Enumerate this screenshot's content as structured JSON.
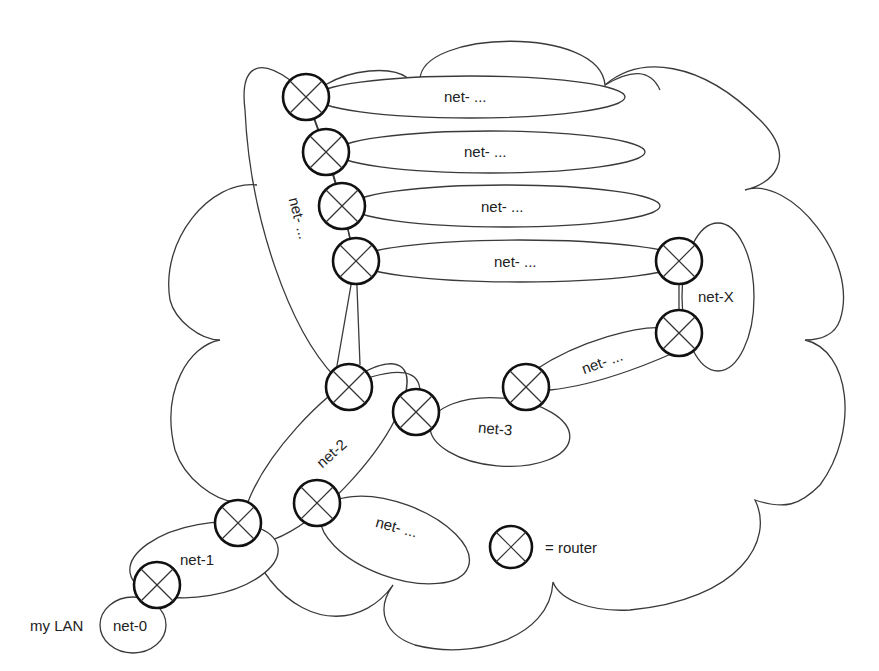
{
  "diagram": {
    "title": "",
    "labels": {
      "my_lan": "my LAN",
      "net0": "net-0",
      "net1": "net-1",
      "net2": "net-2",
      "net3": "net-3",
      "netX": "net-X",
      "net_top1": "net- ...",
      "net_top2": "net- ...",
      "net_top3": "net- ...",
      "net_top4": "net- ...",
      "net_vertical": "net- ...",
      "net_3_to_X": "net- ...",
      "net_bottom": "net- ..."
    },
    "legend": {
      "symbol": "router-icon",
      "text": "= router"
    },
    "routers": [
      {
        "id": "r0",
        "x": 157,
        "y": 585
      },
      {
        "id": "r1",
        "x": 238,
        "y": 523
      },
      {
        "id": "r2",
        "x": 317,
        "y": 503
      },
      {
        "id": "r3",
        "x": 349,
        "y": 387
      },
      {
        "id": "r4",
        "x": 416,
        "y": 412
      },
      {
        "id": "r5",
        "x": 526,
        "y": 387
      },
      {
        "id": "r6",
        "x": 306,
        "y": 97
      },
      {
        "id": "r7",
        "x": 326,
        "y": 152
      },
      {
        "id": "r8",
        "x": 342,
        "y": 206
      },
      {
        "id": "r9",
        "x": 356,
        "y": 261
      },
      {
        "id": "r10",
        "x": 679,
        "y": 261
      },
      {
        "id": "r11",
        "x": 679,
        "y": 333
      },
      {
        "id": "legend_router",
        "x": 511,
        "y": 547
      }
    ],
    "colors": {
      "stroke": "#3a3a3a",
      "router_stroke": "#111111",
      "background": "#ffffff",
      "text": "#222222"
    }
  }
}
